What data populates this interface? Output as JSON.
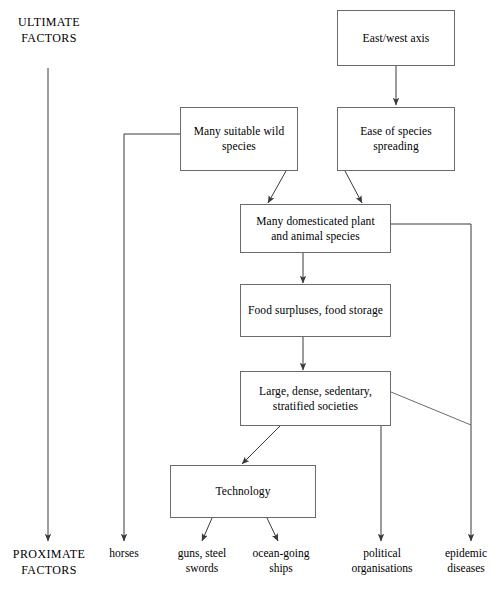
{
  "diagram": {
    "type": "flowchart",
    "stroke_color": "#6b6b6b",
    "text_color": "#000000",
    "background": "#ffffff",
    "axis": {
      "top_label": "ULTIMATE\nFACTORS",
      "bottom_label": "PROXIMATE\nFACTORS"
    },
    "nodes": [
      {
        "id": "east_west_axis",
        "label": "East/west axis"
      },
      {
        "id": "wild_species",
        "label": "Many suitable wild\nspecies"
      },
      {
        "id": "ease_spreading",
        "label": "Ease of species\nspreading"
      },
      {
        "id": "domesticated",
        "label": "Many domesticated plant\nand animal species"
      },
      {
        "id": "food_surpluses",
        "label": "Food surpluses, food storage"
      },
      {
        "id": "societies",
        "label": "Large, dense, sedentary,\nstratified societies"
      },
      {
        "id": "technology",
        "label": "Technology"
      }
    ],
    "outcomes": [
      {
        "id": "horses",
        "label": "horses"
      },
      {
        "id": "guns_swords",
        "label": "guns, steel\nswords"
      },
      {
        "id": "ships",
        "label": "ocean-going\nships"
      },
      {
        "id": "political",
        "label": "political\norganisations"
      },
      {
        "id": "epidemic",
        "label": "epidemic\ndiseases"
      }
    ],
    "edges": [
      {
        "from": "east_west_axis",
        "to": "ease_spreading"
      },
      {
        "from": "wild_species",
        "to": "domesticated"
      },
      {
        "from": "ease_spreading",
        "to": "domesticated"
      },
      {
        "from": "domesticated",
        "to": "food_surpluses"
      },
      {
        "from": "food_surpluses",
        "to": "societies"
      },
      {
        "from": "societies",
        "to": "technology"
      },
      {
        "from": "wild_species",
        "to": "horses"
      },
      {
        "from": "technology",
        "to": "guns_swords"
      },
      {
        "from": "technology",
        "to": "ships"
      },
      {
        "from": "societies",
        "to": "political"
      },
      {
        "from": "domesticated",
        "to": "epidemic"
      },
      {
        "from": "societies",
        "to": "epidemic"
      }
    ]
  }
}
